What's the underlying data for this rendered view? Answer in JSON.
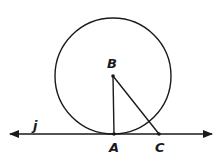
{
  "diagram": {
    "type": "geometry",
    "colors": {
      "ink": "#1a1a1a",
      "background": "#ffffff"
    },
    "circle": {
      "center": "B",
      "cx": 113,
      "cy": 76,
      "r": 58
    },
    "line": {
      "name": "j",
      "y": 134,
      "x1": 10,
      "x2": 212,
      "arrows": "both"
    },
    "points": [
      {
        "name": "B",
        "x": 113,
        "y": 76
      },
      {
        "name": "A",
        "x": 114,
        "y": 134
      },
      {
        "name": "C",
        "x": 159,
        "y": 134
      }
    ],
    "segments": [
      {
        "from": "B",
        "to": "A"
      },
      {
        "from": "B",
        "to": "C"
      }
    ],
    "labels": {
      "line_j": "j",
      "point_A": "A",
      "point_B": "B",
      "point_C": "C"
    }
  }
}
